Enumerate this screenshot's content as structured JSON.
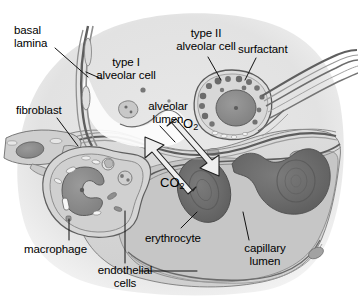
{
  "figure": {
    "background_color": "#ffffff"
  },
  "labels": [
    {
      "id": "basal-lamina",
      "text": "basal\nlamina",
      "x": 14,
      "y": 24,
      "align": "left"
    },
    {
      "id": "type-i",
      "text": "type I\nalveolar cell",
      "x": 80,
      "y": 56,
      "align": "center"
    },
    {
      "id": "type-ii",
      "text": "type II\nalveolar cell",
      "x": 160,
      "y": 27,
      "align": "center"
    },
    {
      "id": "surfactant",
      "text": "surfactant",
      "x": 238,
      "y": 43,
      "align": "left"
    },
    {
      "id": "fibroblast",
      "text": "fibroblast",
      "x": 16,
      "y": 104,
      "align": "left"
    },
    {
      "id": "alveolar-lumen",
      "text": "alveolar\nlumen",
      "x": 138,
      "y": 100,
      "align": "center"
    },
    {
      "id": "macrophage",
      "text": "macrophage",
      "x": 24,
      "y": 243,
      "align": "left"
    },
    {
      "id": "erythrocyte",
      "text": "erythrocyte",
      "x": 145,
      "y": 232,
      "align": "left"
    },
    {
      "id": "endothelial-cells",
      "text": "endothelial\ncells",
      "x": 71,
      "y": 267,
      "align": "center"
    },
    {
      "id": "capillary-lumen",
      "text": "capillary\nlumen",
      "x": 234,
      "y": 242,
      "align": "center"
    }
  ],
  "gas_labels": [
    {
      "id": "o2",
      "base": "O",
      "sub": "2",
      "x": 183,
      "y": 117,
      "direction": "into blood"
    },
    {
      "id": "co2",
      "base": "CO",
      "sub": "2",
      "x": 160,
      "y": 176,
      "direction": "out of blood"
    }
  ],
  "leader_lines": [
    {
      "for": "basal-lamina",
      "x1": 55,
      "y1": 48,
      "x2": 88,
      "y2": 76
    },
    {
      "for": "type-i",
      "x1": 101,
      "y1": 79,
      "x2": 86,
      "y2": 73
    },
    {
      "for": "type-ii",
      "x1": 208,
      "y1": 57,
      "x2": 222,
      "y2": 79
    },
    {
      "for": "surfactant",
      "x1": 255,
      "y1": 58,
      "x2": 244,
      "y2": 79
    },
    {
      "for": "fibroblast",
      "x1": 57,
      "y1": 118,
      "x2": 77,
      "y2": 145
    },
    {
      "for": "alveolar-lumen",
      "x1": 160,
      "y1": 126,
      "x2": 174,
      "y2": 143
    },
    {
      "for": "macrophage",
      "x1": 69,
      "y1": 240,
      "x2": 69,
      "y2": 218
    },
    {
      "for": "erythrocyte",
      "x1": 180,
      "y1": 228,
      "x2": 196,
      "y2": 213
    },
    {
      "for": "endothelial-cells",
      "x1": 125,
      "y1": 264,
      "x2": 125,
      "y2": 212
    },
    {
      "for": "endothelial-cells-right",
      "x1": 140,
      "y1": 271,
      "x2": 196,
      "y2": 271
    },
    {
      "for": "capillary-lumen",
      "x1": 248,
      "y1": 240,
      "x2": 243,
      "y2": 213
    }
  ],
  "arrows": [
    {
      "id": "o2-arrow",
      "label": "O2",
      "from": [
        168,
        131
      ],
      "to": [
        211,
        172
      ],
      "note": "oxygen diffuses from alveolar lumen into erythrocyte"
    },
    {
      "id": "co2-arrow",
      "label": "CO2",
      "from": [
        196,
        186
      ],
      "to": [
        157,
        138
      ],
      "note": "carbon dioxide diffuses from blood into alveolar lumen"
    }
  ],
  "structures": {
    "alveolar_wall_fill": "#d4d4d4",
    "outer_halo_fill": "#e6e6e6",
    "alveolar_lumen_fill": "#ffffff",
    "capillary_lumen_fill": "#c4c4c4",
    "erythrocyte_fill": "#6e6e6e",
    "nucleus_fill": "#8e8e8e",
    "membrane_stroke": "#5a5a5a",
    "outline_stroke": "#3a3a3a",
    "arrow_fill": "#efefef",
    "arrow_stroke": "#2a2a2a",
    "leader_stroke": "#111111"
  },
  "erythrocytes": [
    {
      "id": "erythrocyte-center",
      "cx": 204,
      "cy": 190,
      "rx": 26,
      "ry": 32,
      "rotate": -18
    },
    {
      "id": "erythrocyte-right",
      "cx": 285,
      "cy": 178,
      "rx": 30,
      "ry": 30,
      "rotate": 12
    },
    {
      "id": "erythrocyte-right-tail",
      "cx": 247,
      "cy": 168,
      "rx": 18,
      "ry": 10,
      "rotate": 25
    }
  ],
  "cells": [
    {
      "id": "type-ii-alveolar-cell",
      "cx": 232,
      "cy": 103,
      "rx": 39,
      "ry": 33
    },
    {
      "id": "macrophage",
      "cx": 89,
      "cy": 190,
      "rx": 53,
      "ry": 46
    },
    {
      "id": "fibroblast",
      "cx": 47,
      "cy": 148,
      "rx": 48,
      "ry": 17
    }
  ]
}
